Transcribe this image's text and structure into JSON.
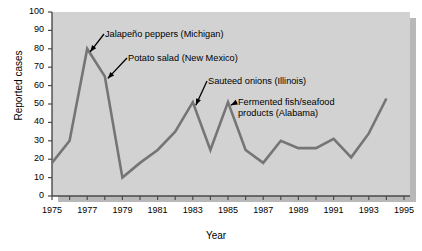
{
  "chart_data": {
    "type": "line",
    "title": "",
    "xlabel": "Year",
    "ylabel": "Reported cases",
    "xlim": [
      1975,
      1995
    ],
    "ylim": [
      0,
      100
    ],
    "grid": false,
    "legend": "none",
    "x": [
      1975,
      1976,
      1977,
      1978,
      1979,
      1980,
      1981,
      1982,
      1983,
      1984,
      1985,
      1986,
      1987,
      1988,
      1989,
      1990,
      1991,
      1992,
      1993,
      1994
    ],
    "values": [
      18,
      30,
      80,
      65,
      10,
      18,
      25,
      35,
      51,
      25,
      51,
      25,
      18,
      30,
      26,
      26,
      31,
      21,
      34,
      53
    ],
    "xticks": [
      1975,
      1976,
      1977,
      1978,
      1979,
      1980,
      1981,
      1982,
      1983,
      1984,
      1985,
      1986,
      1987,
      1988,
      1989,
      1990,
      1991,
      1992,
      1993,
      1994,
      1995
    ],
    "xtick_labels": [
      "1975",
      "1977",
      "1979",
      "1981",
      "1983",
      "1985",
      "1987",
      "1989",
      "1991",
      "1993",
      "1995"
    ],
    "xtick_label_values": [
      1975,
      1977,
      1979,
      1981,
      1983,
      1985,
      1987,
      1989,
      1991,
      1993,
      1995
    ],
    "yticks": [
      0,
      10,
      20,
      30,
      40,
      50,
      60,
      70,
      80,
      90,
      100
    ],
    "ytick_labels": [
      "0",
      "10",
      "20",
      "30",
      "40",
      "50",
      "60",
      "70",
      "80",
      "90",
      "100"
    ],
    "series_color": "#757575",
    "plot_background": "#d2d2d2",
    "annotations": [
      {
        "text": "Jalapeño peppers (Michigan)",
        "point_year": 1977,
        "point_value": 80
      },
      {
        "text": "Potato salad (New Mexico)",
        "point_year": 1978,
        "point_value": 65
      },
      {
        "text": "Sauteed onions (Illinois)",
        "point_year": 1983,
        "point_value": 51
      },
      {
        "text": "Fermented fish/seafood\nproducts (Alabama)",
        "point_year": 1985,
        "point_value": 51
      }
    ]
  }
}
